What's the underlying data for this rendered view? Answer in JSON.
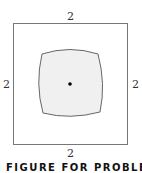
{
  "figure": {
    "labels": {
      "top": "2",
      "bottom": "2",
      "left": "2",
      "right": "2"
    },
    "caption": "FIGURE FOR PROBLEM 16",
    "colors": {
      "outline": "#777777",
      "fill": "#f0f0f0",
      "dot": "#000000"
    }
  }
}
